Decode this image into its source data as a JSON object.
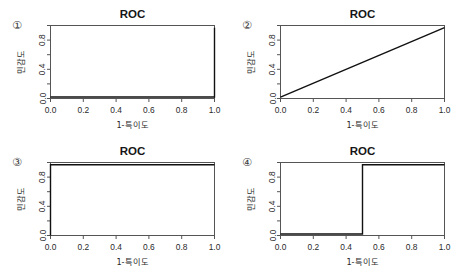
{
  "figure": {
    "background": "#ffffff",
    "layout": "2x2 grid of ROC plots",
    "axis_color": "#555555",
    "curve_color": "#101010"
  },
  "panels": [
    {
      "marker": "①",
      "title": "ROC",
      "xlabel": "1-특이도",
      "ylabel": "민감도"
    },
    {
      "marker": "②",
      "title": "ROC",
      "xlabel": "1-특이도",
      "ylabel": "민감도"
    },
    {
      "marker": "③",
      "title": "ROC",
      "xlabel": "1-특이도",
      "ylabel": "민감도"
    },
    {
      "marker": "④",
      "title": "ROC",
      "xlabel": "1-특이도",
      "ylabel": "민감도"
    }
  ],
  "chart_data": [
    {
      "type": "line",
      "title": "ROC",
      "panel_marker": "①",
      "xlabel": "1-특이도",
      "ylabel": "민감도",
      "xlim": [
        0.0,
        1.0
      ],
      "ylim": [
        0.0,
        1.0
      ],
      "xticks": [
        0.0,
        0.2,
        0.4,
        0.6,
        0.8,
        1.0
      ],
      "xtick_labels": [
        "0.0",
        "0.2",
        "0.4",
        "0.6",
        "0.8",
        "1.0"
      ],
      "yticks": [
        0.0,
        0.2,
        0.4,
        0.6,
        0.8,
        1.0
      ],
      "ytick_labels": [
        "0.0",
        "",
        "0.4",
        "",
        "0.8",
        ""
      ],
      "grid": false,
      "legend": "none",
      "description": "Degenerate ROC: sensitivity stays near 0 until 1-specificity reaches 1.0, then jumps vertically to 1.0 (AUC ≈ 0.0)",
      "x": [
        0.0,
        0.99,
        1.0,
        1.0
      ],
      "y": [
        0.02,
        0.02,
        0.02,
        0.97
      ]
    },
    {
      "type": "line",
      "title": "ROC",
      "panel_marker": "②",
      "xlabel": "1-특이도",
      "ylabel": "민감도",
      "xlim": [
        0.0,
        1.0
      ],
      "ylim": [
        0.0,
        1.0
      ],
      "xticks": [
        0.0,
        0.2,
        0.4,
        0.6,
        0.8,
        1.0
      ],
      "xtick_labels": [
        "0.0",
        "0.2",
        "0.4",
        "0.6",
        "0.8",
        "1.0"
      ],
      "yticks": [
        0.0,
        0.2,
        0.4,
        0.6,
        0.8,
        1.0
      ],
      "ytick_labels": [
        "0.0",
        "",
        "0.4",
        "",
        "0.8",
        ""
      ],
      "grid": false,
      "legend": "none",
      "description": "Chance-level diagonal ROC line from (0,0) to (1,1) (AUC ≈ 0.5)",
      "x": [
        0.0,
        1.0
      ],
      "y": [
        0.02,
        0.97
      ]
    },
    {
      "type": "line",
      "title": "ROC",
      "panel_marker": "③",
      "xlabel": "1-특이도",
      "ylabel": "민감도",
      "xlim": [
        0.0,
        1.0
      ],
      "ylim": [
        0.0,
        1.0
      ],
      "xticks": [
        0.0,
        0.2,
        0.4,
        0.6,
        0.8,
        1.0
      ],
      "xtick_labels": [
        "0.0",
        "0.2",
        "0.4",
        "0.6",
        "0.8",
        "1.0"
      ],
      "yticks": [
        0.0,
        0.2,
        0.4,
        0.6,
        0.8,
        1.0
      ],
      "ytick_labels": [
        "0.0",
        "",
        "0.4",
        "",
        "0.8",
        ""
      ],
      "grid": false,
      "legend": "none",
      "description": "Perfect ROC: rises vertically at 1-specificity = 0 to sensitivity 1.0, then flat across the top (AUC ≈ 1.0)",
      "x": [
        0.0,
        0.0,
        1.0
      ],
      "y": [
        0.0,
        0.97,
        0.97
      ]
    },
    {
      "type": "line",
      "title": "ROC",
      "panel_marker": "④",
      "xlabel": "1-특이도",
      "ylabel": "민감도",
      "xlim": [
        0.0,
        1.0
      ],
      "ylim": [
        0.0,
        1.0
      ],
      "xticks": [
        0.0,
        0.2,
        0.4,
        0.6,
        0.8,
        1.0
      ],
      "xtick_labels": [
        "0.0",
        "0.2",
        "0.4",
        "0.6",
        "0.8",
        "1.0"
      ],
      "yticks": [
        0.0,
        0.2,
        0.4,
        0.6,
        0.8,
        1.0
      ],
      "ytick_labels": [
        "0.0",
        "",
        "0.4",
        "",
        "0.8",
        ""
      ],
      "grid": false,
      "legend": "none",
      "description": "Step ROC: sensitivity near 0 until 1-specificity = 0.5, then jumps to 1.0 and stays flat (AUC ≈ 0.5)",
      "x": [
        0.0,
        0.5,
        0.5,
        1.0
      ],
      "y": [
        0.02,
        0.02,
        0.97,
        0.97
      ]
    }
  ]
}
